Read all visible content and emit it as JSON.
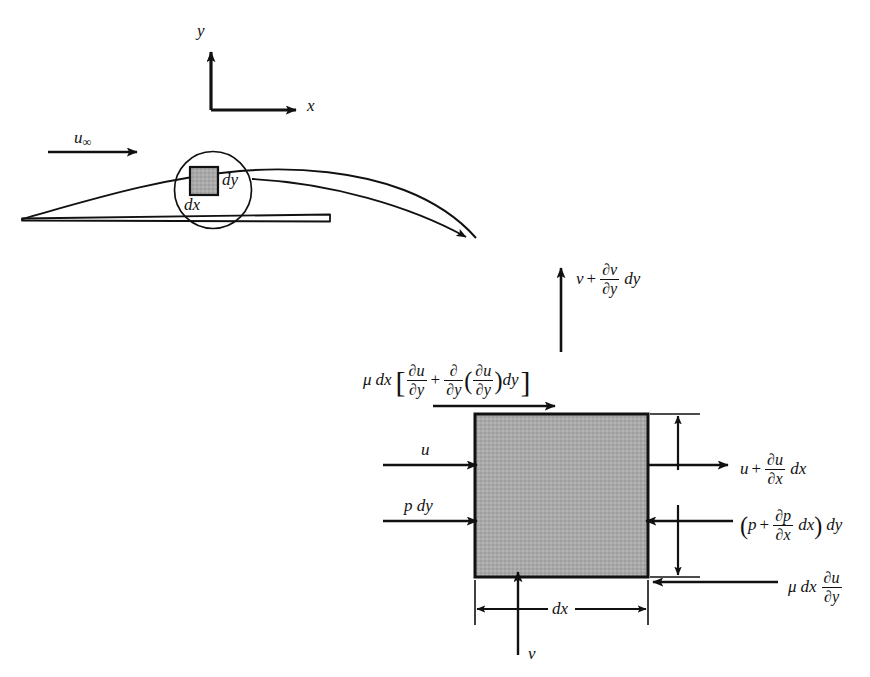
{
  "figure": {
    "background_color": "#ffffff",
    "ink_color": "#111111",
    "element_fill_color": "#a8a8a8"
  },
  "axes": {
    "y_label": "y",
    "x_label": "x"
  },
  "upstream": {
    "freestream_label": "u",
    "freestream_subscript": "∞"
  },
  "detail_circle": {
    "dy_label": "dy",
    "dx_label": "dx"
  },
  "control_volume": {
    "top_flux": {
      "v": "v",
      "plus": "+",
      "frac_num": "∂v",
      "frac_den": "∂y",
      "tail": "dy"
    },
    "top_shear": {
      "mu": "μ",
      "dx": "dx",
      "bracket_open": "[",
      "frac1_num": "∂u",
      "frac1_den": "∂y",
      "plus": "+",
      "frac2_num": "∂",
      "frac2_den": "∂y",
      "paren_open": "(",
      "frac3_num": "∂u",
      "frac3_den": "∂y",
      "paren_close": ")",
      "tail": "dy",
      "bracket_close": "]"
    },
    "left_velocity": "u",
    "left_pressure": "p dy",
    "right_velocity": {
      "u": "u",
      "plus": "+",
      "frac_num": "∂u",
      "frac_den": "∂x",
      "tail": "dx"
    },
    "right_pressure": {
      "open": "(",
      "p": "p",
      "plus": "+",
      "frac_num": "∂p",
      "frac_den": "∂x",
      "inner_tail": "dx",
      "close": ")",
      "tail": "dy"
    },
    "bottom_shear": {
      "mu": "μ",
      "dx": "dx",
      "frac_num": "∂u",
      "frac_den": "∂y"
    },
    "bottom_flux": "v",
    "width_label": "dx"
  }
}
